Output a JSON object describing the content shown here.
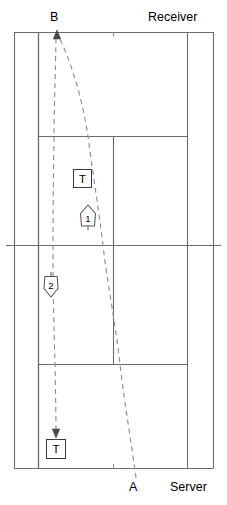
{
  "diagram": {
    "type": "tennis-court-serve-diagram",
    "title_labels": {
      "top_player_point": "B",
      "top_role": "Receiver",
      "bottom_player_point": "A",
      "bottom_role": "Server"
    },
    "markers": [
      {
        "id": "t-top",
        "label": "T",
        "shape": "square",
        "x": 82,
        "y": 178
      },
      {
        "id": "m1",
        "label": "1",
        "shape": "arrow-up-pentagon",
        "x": 88,
        "y": 218
      },
      {
        "id": "m2",
        "label": "2",
        "shape": "arrow-down-pentagon",
        "x": 51,
        "y": 285
      },
      {
        "id": "t-bottom",
        "label": "T",
        "shape": "square",
        "x": 56,
        "y": 449
      }
    ],
    "colors": {
      "court_line": "#6b6b6b",
      "court_line_dark": "#4a4a4a",
      "trajectory": "#8a8a8a",
      "text": "#000000",
      "background": "#ffffff"
    },
    "court": {
      "doubles_left_x": 14,
      "singles_left_x": 38,
      "center_line_x": 113,
      "singles_right_x": 187,
      "doubles_right_x": 213,
      "top_baseline_y": 32,
      "top_service_line_y": 136,
      "net_y": 245,
      "bottom_service_line_y": 364,
      "bottom_baseline_y": 468
    },
    "trajectories": [
      {
        "id": "serve-path-A-to-B",
        "style": "dashed",
        "from": "A",
        "to": "B",
        "points": "136,478 120,364 103,245 88,136 72,60 58,34"
      },
      {
        "id": "return-path-B-to-T",
        "style": "dashed",
        "from": "B",
        "to": "T-bottom",
        "points": "56,34 54,136 53,245 55,364 56,432"
      }
    ]
  }
}
